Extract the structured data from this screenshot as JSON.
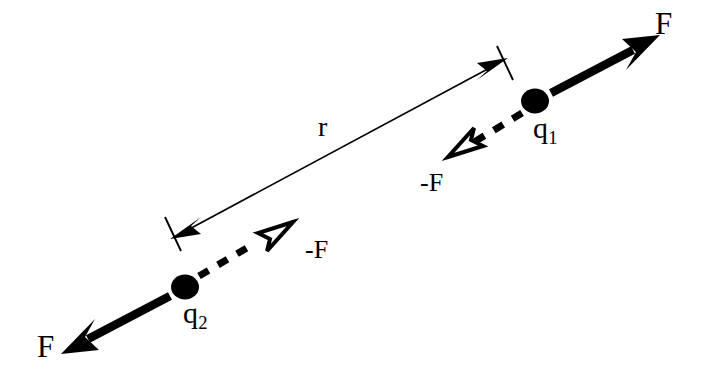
{
  "figure": {
    "background_color": "#ffffff",
    "stroke_color": "#000000",
    "width": 712,
    "height": 388
  },
  "labels": {
    "force_on_q1": "F",
    "force_on_q2": "F",
    "reaction_near_q1": "-F",
    "reaction_near_q2": "-F",
    "charge_1": "q",
    "charge_1_subscript": "1",
    "charge_2": "q",
    "charge_2_subscript": "2",
    "separation": "r"
  },
  "elements": {
    "charge_1_dot": "filled-circle",
    "charge_2_dot": "filled-circle",
    "solid_force_arrow": "solid-barbed-arrow",
    "dashed_reaction_arrow": "dashed-hollow-arrow",
    "separation_line": "double-headed-dimension-line"
  },
  "geometry": {
    "q1_x": 535,
    "q1_y": 101,
    "q2_x": 185,
    "q2_y": 287,
    "axis_angle_deg": -28,
    "dot_radius": 13
  }
}
